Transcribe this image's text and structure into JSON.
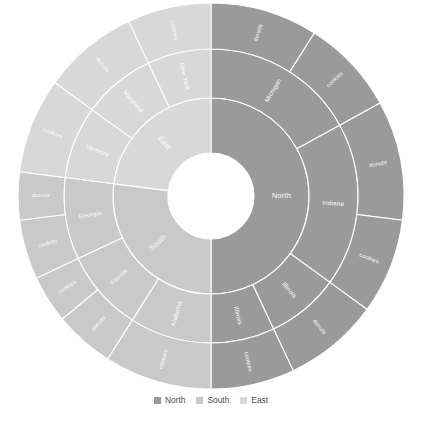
{
  "chart_data": {
    "type": "pie",
    "subtype": "sunburst",
    "title": "",
    "xlabel": "",
    "ylabel": "",
    "grid": false,
    "legend_position": "bottom",
    "center": {
      "x": 211,
      "y": 196
    },
    "rings": [
      {
        "name": "region",
        "level": 1,
        "inner_radius": 43,
        "outer_radius": 98
      },
      {
        "name": "state",
        "level": 2,
        "inner_radius": 98,
        "outer_radius": 147
      },
      {
        "name": "product",
        "level": 3,
        "inner_radius": 147,
        "outer_radius": 193
      }
    ],
    "start_angle_deg": 0,
    "direction": "clockwise",
    "categories": [
      "North",
      "South",
      "East"
    ],
    "values": [
      50,
      27,
      23
    ],
    "hierarchy": [
      {
        "label": "North",
        "value": 50,
        "color": "#9a9a9a",
        "children": [
          {
            "label": "Michigan",
            "value": 17,
            "color": "#9a9a9a",
            "children": [
              {
                "label": "donuts",
                "value": 9,
                "color": "#9a9a9a"
              },
              {
                "label": "cookies",
                "value": 8,
                "color": "#9a9a9a"
              }
            ]
          },
          {
            "label": "Indiana",
            "value": 18,
            "color": "#9a9a9a",
            "children": [
              {
                "label": "donuts",
                "value": 10,
                "color": "#9a9a9a"
              },
              {
                "label": "cookies",
                "value": 8,
                "color": "#9a9a9a"
              }
            ]
          },
          {
            "label": "Illinois",
            "value": 8,
            "color": "#9a9a9a",
            "children": [
              {
                "label": "donuts",
                "value": 8,
                "color": "#9a9a9a"
              }
            ]
          },
          {
            "label": "Illinois",
            "value": 7,
            "color": "#9a9a9a",
            "children": [
              {
                "label": "cookies",
                "value": 7,
                "color": "#9a9a9a"
              }
            ]
          }
        ]
      },
      {
        "label": "South",
        "value": 27,
        "color": "#c9c9c9",
        "children": [
          {
            "label": "Alabama",
            "value": 9,
            "color": "#c9c9c9",
            "children": [
              {
                "label": "cookies",
                "value": 9,
                "color": "#c9c9c9"
              }
            ]
          },
          {
            "label": "Florida",
            "value": 9,
            "color": "#c9c9c9",
            "children": [
              {
                "label": "donuts",
                "value": 5,
                "color": "#c9c9c9"
              },
              {
                "label": "cookies",
                "value": 4,
                "color": "#c9c9c9"
              }
            ]
          },
          {
            "label": "Georgia",
            "value": 9,
            "color": "#c9c9c9",
            "children": [
              {
                "label": "cookies",
                "value": 5,
                "color": "#c9c9c9"
              },
              {
                "label": "donuts",
                "value": 4,
                "color": "#c9c9c9"
              }
            ]
          }
        ]
      },
      {
        "label": "East",
        "value": 23,
        "color": "#d8d8d8",
        "children": [
          {
            "label": "Vermont",
            "value": 8,
            "color": "#d8d8d8",
            "children": [
              {
                "label": "cookies",
                "value": 8,
                "color": "#d8d8d8"
              }
            ]
          },
          {
            "label": "Maryland",
            "value": 8,
            "color": "#d8d8d8",
            "children": [
              {
                "label": "donuts",
                "value": 8,
                "color": "#d8d8d8"
              }
            ]
          },
          {
            "label": "New York",
            "value": 7,
            "color": "#d8d8d8",
            "children": [
              {
                "label": "cookies",
                "value": 7,
                "color": "#d8d8d8"
              }
            ]
          }
        ]
      }
    ],
    "legend": [
      {
        "label": "North",
        "color": "#9a9a9a"
      },
      {
        "label": "South",
        "color": "#c9c9c9"
      },
      {
        "label": "East",
        "color": "#d8d8d8"
      }
    ]
  },
  "caption": {
    "text": ""
  }
}
